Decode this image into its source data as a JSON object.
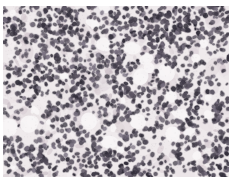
{
  "figure": {
    "alt": "Photomicrograph of a tissue section showing sheets of densely packed small round cells with dark nuclei on a pale pink background",
    "canvas": {
      "width": 234,
      "height": 184,
      "page_background": "#ffffff"
    },
    "micrograph_rect": {
      "x": 3,
      "y": 6,
      "width": 226,
      "height": 171
    },
    "palette": {
      "base_background": "#efeaec",
      "background_patches": [
        "#ded5da",
        "#e7dfe3",
        "#f6f3f4",
        "#d7ccd3"
      ],
      "cytoplasm_blobs": [
        "#cfc3ca",
        "#c3b6bf",
        "#d9cdd3"
      ],
      "nuclei": [
        "#332f3b",
        "#423d4a",
        "#514b58",
        "#5d5664",
        "#746c7c"
      ],
      "clear_space": "#f7f5f6",
      "grain_dark": "#6a6270",
      "grain_light": "#ffffff"
    },
    "render": {
      "seed": 1337,
      "noise_cols": 10,
      "noise_rows": 8,
      "background_patch_count": 130,
      "cytoplasm_blob_count": 230,
      "clear_space_count": 30,
      "clear_space_min_r": 3,
      "clear_space_max_r": 9,
      "nuclei_attempts": 2100,
      "nucleus_min_rx": 1.3,
      "nucleus_max_rx": 2.6,
      "cluster_probability": 0.25,
      "grain_count": 2600
    }
  }
}
